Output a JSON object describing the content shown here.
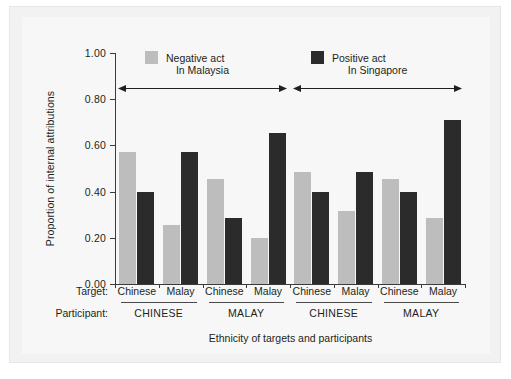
{
  "chart_data": {
    "type": "bar",
    "title": "",
    "xlabel": "Ethnicity of targets and participants",
    "ylabel": "Proportion of internal attributions",
    "ylim": [
      0.0,
      1.0
    ],
    "ytick_labels": [
      "0.00",
      "0.20",
      "0.40",
      "0.60",
      "0.80",
      "1.00"
    ],
    "ytick_values": [
      0.0,
      0.2,
      0.4,
      0.6,
      0.8,
      1.0
    ],
    "grid": false,
    "legend_position": "top-inside",
    "categories": [
      "Chinese",
      "Malay",
      "Chinese",
      "Malay",
      "Chinese",
      "Malay",
      "Chinese",
      "Malay"
    ],
    "series": [
      {
        "name": "Negative act",
        "color": "#bdbdbd",
        "values": [
          0.57,
          0.255,
          0.455,
          0.2,
          0.485,
          0.315,
          0.455,
          0.285
        ]
      },
      {
        "name": "Positive act",
        "color": "#2b2b2b",
        "values": [
          0.4,
          0.57,
          0.285,
          0.655,
          0.4,
          0.485,
          0.4,
          0.71
        ]
      }
    ],
    "group_rows": [
      {
        "row_label": "Target:",
        "cells": [
          "Chinese",
          "Malay",
          "Chinese",
          "Malay",
          "Chinese",
          "Malay",
          "Chinese",
          "Malay"
        ]
      },
      {
        "row_label": "Participant:",
        "cells": [
          "CHINESE",
          "MALAY",
          "CHINESE",
          "MALAY"
        ]
      }
    ],
    "annotations": [
      {
        "label": "In Malaysia",
        "style": "double-arrow",
        "spans_groups": [
          0,
          1
        ]
      },
      {
        "label": "In Singapore",
        "style": "double-arrow",
        "spans_groups": [
          2,
          3
        ]
      }
    ]
  },
  "colors": {
    "negative_act": "#bdbdbd",
    "positive_act": "#2b2b2b",
    "axis": "#3b3b3b",
    "text": "#231f20",
    "panel_background": "#f2f2f2",
    "plot_background": "#f7f7f7"
  }
}
